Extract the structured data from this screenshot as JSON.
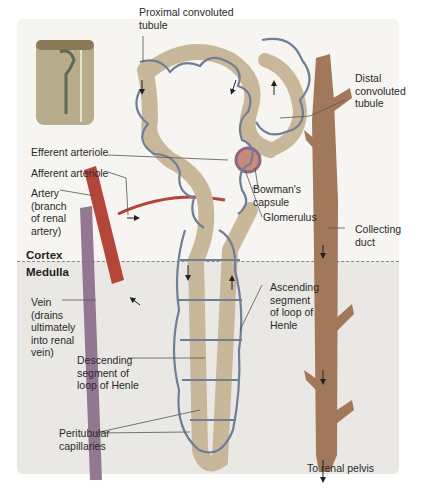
{
  "zones": {
    "cortex": "Cortex",
    "medulla": "Medulla"
  },
  "labels": {
    "proximal": "Proximal convoluted\ntubule",
    "distal": "Distal\nconvoluted\ntubule",
    "efferent": "Efferent arteriole",
    "afferent": "Afferent arteriole",
    "artery": "Artery\n(branch\nof renal\nartery)",
    "bowman": "Bowman's\ncapsule",
    "glomerulus": "Glomerulus",
    "collecting": "Collecting\nduct",
    "ascending": "Ascending\nsegment\nof loop of\nHenle",
    "vein": "Vein\n(drains\nultimately\ninto renal\nvein)",
    "descending": "Descending\nsegment of\nloop of Henle",
    "peritubular": "Peritubular\ncapillaries",
    "pelvis": "To renal pelvis"
  },
  "colors": {
    "tubule": "#c9b79a",
    "capillary": "#6f7f95",
    "artery": "#b5453b",
    "duct": "#a2785b",
    "cortex_bg": "#f6f5f1",
    "medulla_bg": "#e9e8e5"
  }
}
